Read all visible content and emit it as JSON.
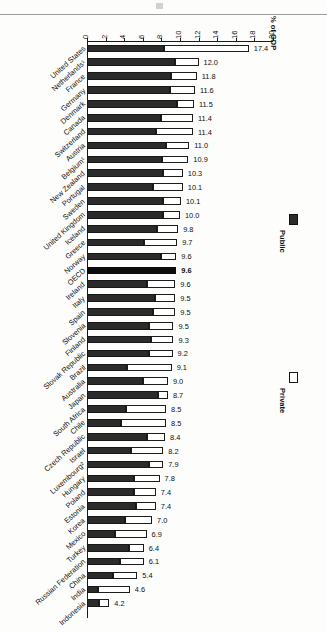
{
  "chart_data": {
    "type": "bar",
    "orientation": "horizontal-stacked",
    "title": "",
    "xlabel": "% of GDP",
    "ylabel": "",
    "xlim": [
      0,
      20
    ],
    "xticks": [
      "0",
      "2",
      "4",
      "6",
      "8",
      "10",
      "12",
      "14",
      "16",
      "18",
      "20"
    ],
    "grid": false,
    "legend_position": "right",
    "legend": [
      {
        "name": "Public",
        "color": "#2b2b2b"
      },
      {
        "name": "Private",
        "color": "#ffffff"
      }
    ],
    "categories": [
      "United States",
      "Netherlands¹",
      "France",
      "Germany",
      "Denmark",
      "Canada",
      "Switzerland",
      "Austria",
      "Belgium¹",
      "New Zealand",
      "Portugal",
      "Sweden",
      "United Kingdom",
      "Iceland",
      "Greece",
      "Norway",
      "OECD",
      "Ireland",
      "Italy",
      "Spain",
      "Slovenia",
      "Finland",
      "Slovak Republic",
      "Brazil",
      "Australia",
      "Japan",
      "South Africa",
      "Chile",
      "Czech Republic",
      "Israel",
      "Luxembourg²",
      "Hungary",
      "Poland",
      "Estonia",
      "Korea",
      "Mexico",
      "Turkey",
      "Russian Federation",
      "China",
      "India",
      "Indonesia"
    ],
    "series": [
      {
        "name": "Public",
        "values": [
          8.3,
          9.5,
          9.0,
          8.9,
          9.7,
          8.0,
          7.4,
          8.5,
          8.1,
          8.2,
          7.1,
          8.2,
          8.2,
          7.5,
          6.1,
          8.0,
          9.6,
          6.5,
          7.3,
          7.1,
          6.7,
          6.9,
          6.7,
          4.3,
          6.0,
          7.6,
          4.2,
          3.7,
          6.4,
          4.7,
          6.7,
          5.1,
          5.1,
          5.3,
          4.1,
          3.0,
          4.5,
          3.5,
          2.8,
          1.2,
          1.3
        ]
      },
      {
        "name": "Private",
        "values": [
          9.1,
          2.5,
          2.8,
          2.7,
          1.8,
          3.4,
          4.0,
          2.5,
          2.8,
          2.1,
          3.2,
          1.9,
          1.8,
          2.3,
          3.6,
          1.6,
          0.0,
          3.0,
          2.2,
          2.4,
          2.6,
          2.4,
          2.5,
          4.8,
          2.7,
          1.1,
          4.3,
          4.8,
          2.0,
          3.5,
          1.5,
          2.7,
          2.3,
          2.1,
          2.9,
          3.4,
          1.6,
          2.6,
          2.6,
          3.4,
          1.1
        ]
      }
    ],
    "total_labels": [
      "17.4",
      "12.0",
      "11.8",
      "11.6",
      "11.5",
      "11.4",
      "11.4",
      "11.0",
      "10.9",
      "10.3",
      "10.1",
      "10.1",
      "10.0",
      "9.8",
      "9.7",
      "9.6",
      "9.6",
      "9.6",
      "9.5",
      "9.5",
      "9.5",
      "9.3",
      "9.2",
      "9.1",
      "9.0",
      "8.7",
      "8.5",
      "8.5",
      "8.4",
      "8.2",
      "7.9",
      "7.8",
      "7.4",
      "7.4",
      "7.0",
      "6.9",
      "6.4",
      "6.1",
      "5.4",
      "4.6",
      "4.2",
      "2.4"
    ],
    "totals": [
      17.4,
      12.0,
      11.8,
      11.6,
      11.5,
      11.4,
      11.4,
      11.0,
      10.9,
      10.3,
      10.3,
      10.1,
      10.0,
      9.8,
      9.7,
      9.6,
      9.6,
      9.5,
      9.5,
      9.5,
      9.3,
      9.2,
      9.1,
      9.0,
      8.7,
      8.5,
      8.5,
      8.4,
      8.2,
      7.9,
      7.8,
      7.4,
      7.4,
      7.0,
      6.9,
      6.4,
      6.1,
      5.4,
      4.6,
      4.2,
      2.4
    ],
    "emphasized_category": "OECD"
  }
}
